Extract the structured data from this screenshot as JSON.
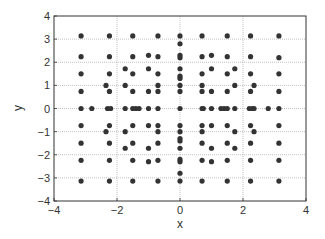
{
  "chart_data": {
    "type": "scatter",
    "title": "",
    "xlabel": "x",
    "ylabel": "y",
    "xlim": [
      -4,
      4
    ],
    "ylim": [
      -4,
      4
    ],
    "xticks": [
      -4,
      -2,
      0,
      2,
      4
    ],
    "yticks": [
      -4,
      -3,
      -2,
      -1,
      0,
      1,
      2,
      3,
      4
    ],
    "grid": true,
    "legend": null,
    "marker_color": "#333333",
    "points": [
      [
        -3.14,
        3.14
      ],
      [
        -2.24,
        3.14
      ],
      [
        -1.5,
        3.14
      ],
      [
        -0.7,
        3.14
      ],
      [
        0,
        3.14
      ],
      [
        0.7,
        3.14
      ],
      [
        1.5,
        3.14
      ],
      [
        2.24,
        3.14
      ],
      [
        3.14,
        3.14
      ],
      [
        0,
        2.8
      ],
      [
        -3.14,
        2.24
      ],
      [
        -2.24,
        2.24
      ],
      [
        -1.5,
        2.24
      ],
      [
        -1.0,
        2.3
      ],
      [
        -0.7,
        2.24
      ],
      [
        0,
        2.3
      ],
      [
        0,
        2.2
      ],
      [
        0.7,
        2.24
      ],
      [
        1.0,
        2.3
      ],
      [
        1.5,
        2.24
      ],
      [
        2.24,
        2.24
      ],
      [
        3.14,
        2.2
      ],
      [
        -1.74,
        1.72
      ],
      [
        -1.0,
        1.72
      ],
      [
        0,
        1.72
      ],
      [
        1.0,
        1.72
      ],
      [
        1.74,
        1.72
      ],
      [
        -3.14,
        1.5
      ],
      [
        -2.24,
        1.5
      ],
      [
        -1.5,
        1.5
      ],
      [
        -0.7,
        1.5
      ],
      [
        0,
        1.4
      ],
      [
        0,
        1.3
      ],
      [
        0.7,
        1.5
      ],
      [
        1.5,
        1.5
      ],
      [
        2.24,
        1.5
      ],
      [
        3.14,
        1.5
      ],
      [
        -2.35,
        1.0
      ],
      [
        -1.74,
        1.0
      ],
      [
        -0.7,
        1.0
      ],
      [
        0,
        1.0
      ],
      [
        0.7,
        1.0
      ],
      [
        1.74,
        1.0
      ],
      [
        2.35,
        1.0
      ],
      [
        -3.14,
        0.74
      ],
      [
        -2.24,
        0.74
      ],
      [
        -1.5,
        0.74
      ],
      [
        -1.0,
        0.74
      ],
      [
        -0.7,
        0.74
      ],
      [
        0,
        0.74
      ],
      [
        0.7,
        0.74
      ],
      [
        1.0,
        0.74
      ],
      [
        1.5,
        0.74
      ],
      [
        2.24,
        0.74
      ],
      [
        3.14,
        0.74
      ],
      [
        -3.14,
        0
      ],
      [
        -2.8,
        0
      ],
      [
        -2.3,
        0
      ],
      [
        -2.2,
        0
      ],
      [
        -1.74,
        0
      ],
      [
        -1.5,
        0
      ],
      [
        -1.4,
        0
      ],
      [
        -1.3,
        0
      ],
      [
        -1.0,
        0
      ],
      [
        -0.7,
        0
      ],
      [
        0,
        0
      ],
      [
        0.7,
        0
      ],
      [
        0.74,
        0
      ],
      [
        1.0,
        0
      ],
      [
        1.3,
        0
      ],
      [
        1.4,
        0
      ],
      [
        1.5,
        0
      ],
      [
        1.74,
        0
      ],
      [
        2.2,
        0
      ],
      [
        2.3,
        0
      ],
      [
        2.35,
        0
      ],
      [
        2.8,
        0
      ],
      [
        3.14,
        0
      ],
      [
        -3.14,
        -0.74
      ],
      [
        -2.24,
        -0.74
      ],
      [
        -1.5,
        -0.74
      ],
      [
        -1.0,
        -0.74
      ],
      [
        -0.7,
        -0.74
      ],
      [
        0,
        -0.74
      ],
      [
        0.7,
        -0.74
      ],
      [
        1.0,
        -0.74
      ],
      [
        1.5,
        -0.74
      ],
      [
        2.24,
        -0.74
      ],
      [
        3.14,
        -0.74
      ],
      [
        -2.35,
        -1.0
      ],
      [
        -1.74,
        -1.0
      ],
      [
        -0.7,
        -1.0
      ],
      [
        0,
        -1.0
      ],
      [
        0.7,
        -1.0
      ],
      [
        1.74,
        -1.0
      ],
      [
        2.35,
        -1.0
      ],
      [
        -3.14,
        -1.5
      ],
      [
        -2.24,
        -1.5
      ],
      [
        -1.5,
        -1.5
      ],
      [
        -0.7,
        -1.5
      ],
      [
        0,
        -1.4
      ],
      [
        0,
        -1.3
      ],
      [
        0.7,
        -1.5
      ],
      [
        1.5,
        -1.5
      ],
      [
        2.24,
        -1.5
      ],
      [
        3.14,
        -1.5
      ],
      [
        -1.74,
        -1.72
      ],
      [
        -1.0,
        -1.72
      ],
      [
        0,
        -1.72
      ],
      [
        1.0,
        -1.72
      ],
      [
        1.74,
        -1.72
      ],
      [
        -3.14,
        -2.24
      ],
      [
        -2.24,
        -2.24
      ],
      [
        -1.5,
        -2.24
      ],
      [
        -1.0,
        -2.3
      ],
      [
        -0.7,
        -2.24
      ],
      [
        0,
        -2.3
      ],
      [
        0,
        -2.2
      ],
      [
        0.7,
        -2.24
      ],
      [
        1.0,
        -2.3
      ],
      [
        1.5,
        -2.24
      ],
      [
        2.24,
        -2.24
      ],
      [
        3.14,
        -2.24
      ],
      [
        0,
        -2.8
      ],
      [
        -3.14,
        -3.14
      ],
      [
        -2.24,
        -3.14
      ],
      [
        -1.5,
        -3.14
      ],
      [
        -0.7,
        -3.14
      ],
      [
        0,
        -3.14
      ],
      [
        0.7,
        -3.14
      ],
      [
        1.5,
        -3.14
      ],
      [
        2.24,
        -3.14
      ],
      [
        3.14,
        -3.14
      ]
    ]
  }
}
